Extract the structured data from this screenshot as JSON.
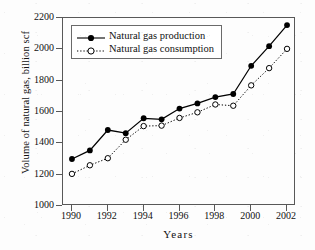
{
  "chart_data": {
    "type": "line",
    "title": "",
    "xlabel": "Years",
    "ylabel": "Volume of natural gas, billion scf",
    "x": [
      1990,
      1991,
      1992,
      1993,
      1994,
      1995,
      1996,
      1997,
      1998,
      1999,
      2000,
      2001,
      2002
    ],
    "xlim": [
      1989.5,
      2002.5
    ],
    "ylim": [
      1000,
      2200
    ],
    "ytick_labels": [
      "1000",
      "1200",
      "1400",
      "1600",
      "1800",
      "2000",
      "2200"
    ],
    "yticks": [
      1000,
      1200,
      1400,
      1600,
      1800,
      2000,
      2200
    ],
    "xtick_labels": [
      "1990",
      "1992",
      "1994",
      "1996",
      "1998",
      "2000",
      "2002"
    ],
    "xticks": [
      1990,
      1992,
      1994,
      1996,
      1998,
      2000,
      2002
    ],
    "grid": false,
    "legend_position": "upper left",
    "series": [
      {
        "name": "Natural gas production",
        "marker": "filled-circle",
        "linestyle": "solid",
        "color": "#000000",
        "values": [
          1300,
          1355,
          1485,
          1465,
          1560,
          1553,
          1622,
          1655,
          1695,
          1715,
          1895,
          2020,
          2155
        ]
      },
      {
        "name": "Natural gas consumption",
        "marker": "open-circle",
        "linestyle": "dotted",
        "color": "#000000",
        "values": [
          1205,
          1260,
          1305,
          1423,
          1510,
          1513,
          1562,
          1598,
          1648,
          1640,
          1770,
          1880,
          2003
        ]
      }
    ]
  },
  "legend": {
    "entries": [
      {
        "label": "Natural gas production"
      },
      {
        "label": "Natural gas consumption"
      }
    ]
  },
  "axes": {
    "x_title": "Years",
    "y_title": "Volume of natural gas, billion scf"
  }
}
